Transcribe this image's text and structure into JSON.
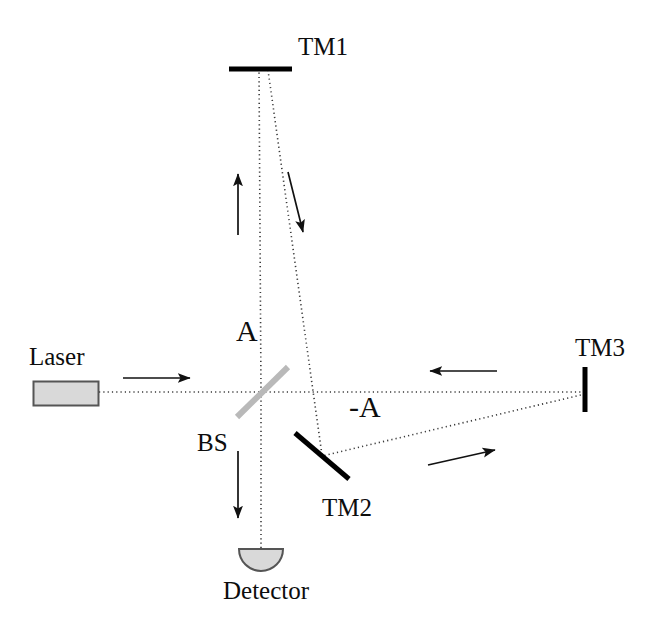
{
  "figure": {
    "width": 655,
    "height": 628,
    "background": "#ffffff"
  },
  "colors": {
    "beam": "#3a3a3a",
    "mirror": "#000000",
    "beamsplitter": "#b9b9b9",
    "arrow": "#111111",
    "component_fill": "#d9d9d9",
    "component_stroke": "#555555",
    "label": "#0d0d0d"
  },
  "labels": {
    "tm1": "TM1",
    "tm2": "TM2",
    "tm3": "TM3",
    "laser": "Laser",
    "bs": "BS",
    "detector": "Detector",
    "amplitude_positive": "A",
    "amplitude_negative": "-A"
  },
  "components": [
    {
      "name": "laser",
      "label": "Laser",
      "shape": "rectangle",
      "x": 33,
      "y": 381,
      "width": 66,
      "height": 25,
      "fill": "#d9d9d9",
      "stroke": "#555555"
    },
    {
      "name": "beam-splitter",
      "label": "BS",
      "shape": "diagonal-line",
      "x1": 237,
      "y1": 417,
      "x2": 288,
      "y2": 367,
      "stroke": "#b9b9b9",
      "stroke_width": 6
    },
    {
      "name": "test-mass-1",
      "label": "TM1",
      "shape": "horizontal-bar",
      "x1": 229,
      "y1": 69,
      "x2": 292,
      "y2": 69,
      "stroke": "#000000",
      "stroke_width": 5
    },
    {
      "name": "test-mass-2",
      "label": "TM2",
      "shape": "diagonal-bar",
      "x1": 295,
      "y1": 433,
      "x2": 349,
      "y2": 479,
      "stroke": "#000000",
      "stroke_width": 5
    },
    {
      "name": "test-mass-3",
      "label": "TM3",
      "shape": "vertical-bar",
      "x1": 585,
      "y1": 367,
      "x2": 585,
      "y2": 412,
      "stroke": "#000000",
      "stroke_width": 5
    },
    {
      "name": "detector",
      "label": "Detector",
      "shape": "half-disc",
      "cx": 261,
      "cy": 549,
      "r": 22,
      "fill": "#d9d9d9",
      "stroke": "#555555"
    }
  ],
  "beams": [
    {
      "name": "laser-to-bs",
      "from": "laser",
      "to": "beam-splitter",
      "style": "dotted",
      "x1": 99,
      "y1": 392,
      "x2": 261,
      "y2": 392
    },
    {
      "name": "bs-to-tm1",
      "from": "beam-splitter",
      "to": "test-mass-1",
      "style": "dotted",
      "x1": 261,
      "y1": 392,
      "x2": 259,
      "y2": 69
    },
    {
      "name": "tm1-to-tm2",
      "from": "test-mass-1",
      "to": "test-mass-2",
      "style": "dotted",
      "x1": 268,
      "y1": 70,
      "x2": 322,
      "y2": 455
    },
    {
      "name": "bs-to-tm3",
      "from": "beam-splitter",
      "to": "test-mass-3",
      "style": "dotted",
      "x1": 261,
      "y1": 392,
      "x2": 585,
      "y2": 392
    },
    {
      "name": "tm3-to-tm2",
      "from": "test-mass-3",
      "to": "test-mass-2",
      "style": "dotted",
      "x1": 585,
      "y1": 394,
      "x2": 322,
      "y2": 456
    },
    {
      "name": "bs-to-detector",
      "from": "beam-splitter",
      "to": "detector",
      "style": "dotted",
      "x1": 261,
      "y1": 392,
      "x2": 261,
      "y2": 549
    }
  ],
  "arrows": [
    {
      "name": "arrow-laser-input",
      "direction": "right",
      "x1": 123,
      "y1": 378,
      "x2": 190,
      "y2": 378
    },
    {
      "name": "arrow-up-to-tm1",
      "direction": "up",
      "x1": 238,
      "y1": 235,
      "x2": 238,
      "y2": 172
    },
    {
      "name": "arrow-down-from-tm1",
      "direction": "down-right",
      "x1": 288,
      "y1": 172,
      "x2": 304,
      "y2": 235
    },
    {
      "name": "arrow-toward-bs-right",
      "direction": "left",
      "x1": 497,
      "y1": 371,
      "x2": 428,
      "y2": 371
    },
    {
      "name": "arrow-toward-tm3",
      "direction": "up-right",
      "x1": 428,
      "y1": 465,
      "x2": 497,
      "y2": 449
    },
    {
      "name": "arrow-to-detector",
      "direction": "down",
      "x1": 238,
      "y1": 451,
      "x2": 238,
      "y2": 520
    }
  ],
  "annotations": [
    {
      "name": "amplitude-positive",
      "text": "A",
      "x": 248,
      "y": 330
    },
    {
      "name": "amplitude-negative",
      "text": "-A",
      "x": 362,
      "y": 407
    }
  ]
}
